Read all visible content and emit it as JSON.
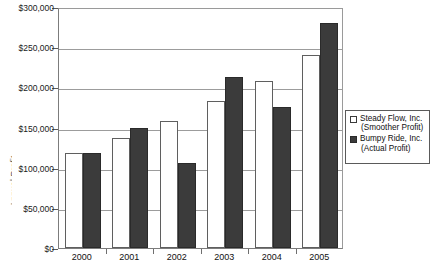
{
  "chart_data": {
    "type": "bar",
    "title": "",
    "xlabel": "",
    "ylabel": "Annual Profit",
    "categories": [
      "2000",
      "2001",
      "2002",
      "2003",
      "2004",
      "2005"
    ],
    "series": [
      {
        "name": "Steady Flow, Inc. (Smoother Profit)",
        "color": "#ffffff",
        "values": [
          118000,
          137500,
          157500,
          182500,
          208500,
          240000
        ]
      },
      {
        "name": "Bumpy Ride, Inc. (Actual Profit)",
        "color": "#3b3b3b",
        "values": [
          118000,
          150000,
          106000,
          212500,
          175000,
          280000
        ]
      }
    ],
    "ylim": [
      0,
      300000
    ],
    "ytick_values": [
      0,
      50000,
      100000,
      150000,
      200000,
      250000,
      300000
    ],
    "ytick_labels": [
      "$0",
      "$50,000",
      "$100,000",
      "$150,000",
      "$200,000",
      "$250,000",
      "$300,000"
    ],
    "grid": "horizontal",
    "legend_position": "right-middle"
  },
  "axis": {
    "y_title_clipped": "Annual Profit"
  },
  "legend": {
    "entries": [
      {
        "swatch": "hollow-square",
        "line1": "Steady Flow, Inc.",
        "line2": "(Smoother Profit)"
      },
      {
        "swatch": "filled-square",
        "line1": "Bumpy Ride, Inc.",
        "line2": "(Actual Profit)"
      }
    ]
  }
}
